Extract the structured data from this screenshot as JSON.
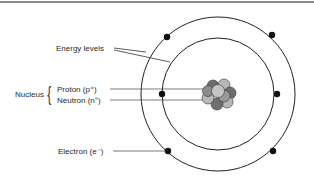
{
  "labels": {
    "energy_levels": "Energy levels",
    "nucleus": "Nucleus",
    "proton": "Proton (p⁺)",
    "neutron": "Neutron (n°)",
    "electron": "Electron (e⁻)"
  },
  "colors": {
    "line": "#222222",
    "proton": "#b8b8b8",
    "neutron": "#6e6e6e",
    "electron": "#111111",
    "top_border": "#8a8a8a"
  },
  "atom": {
    "center": [
      218,
      94
    ],
    "outer_radius": 77,
    "inner_radius": 56,
    "electrons_outer": [
      [
        167,
        37
      ],
      [
        272,
        35
      ],
      [
        168,
        151
      ],
      [
        273,
        151
      ]
    ],
    "electrons_inner": [
      [
        162,
        94
      ],
      [
        277,
        94
      ]
    ]
  }
}
